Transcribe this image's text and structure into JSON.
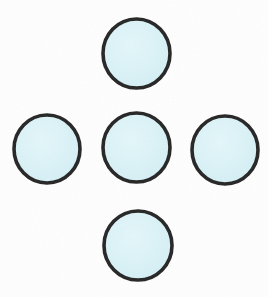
{
  "figure": {
    "name": "five-circles-plus-arrangement",
    "width": 268,
    "height": 297,
    "background_color": "#fefefe",
    "shape_count": 5,
    "arrangement": "plus-cross",
    "style": {
      "fill_color": "#d8f1f6",
      "fill_color_light": "#e4f7fa",
      "stroke_color": "#262626",
      "stroke_width": 3.6,
      "hand_drawn": true
    },
    "circles": [
      {
        "id": "circle-top",
        "position": "top",
        "cx": 136.5,
        "cy": 53.5,
        "rx": 33.5,
        "ry": 34.5,
        "fill": "#d8f1f6",
        "stroke": "#262626"
      },
      {
        "id": "circle-left",
        "position": "left",
        "cx": 47.0,
        "cy": 149.0,
        "rx": 33.0,
        "ry": 34.0,
        "fill": "#d8f1f6",
        "stroke": "#262626"
      },
      {
        "id": "circle-center",
        "position": "center",
        "cx": 136.5,
        "cy": 147.5,
        "rx": 33.5,
        "ry": 34.5,
        "fill": "#d8f1f6",
        "stroke": "#262626"
      },
      {
        "id": "circle-right",
        "position": "right",
        "cx": 225.0,
        "cy": 150.0,
        "rx": 33.0,
        "ry": 34.0,
        "fill": "#d8f1f6",
        "stroke": "#262626"
      },
      {
        "id": "circle-bottom",
        "position": "bottom",
        "cx": 138.0,
        "cy": 245.5,
        "rx": 34.0,
        "ry": 34.5,
        "fill": "#d8f1f6",
        "stroke": "#262626"
      }
    ]
  }
}
